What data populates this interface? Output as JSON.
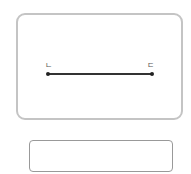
{
  "diagram": {
    "segment": {
      "start_label": "ㄴ",
      "end_label": "ㄷ"
    }
  },
  "answer_box": {
    "value": ""
  }
}
